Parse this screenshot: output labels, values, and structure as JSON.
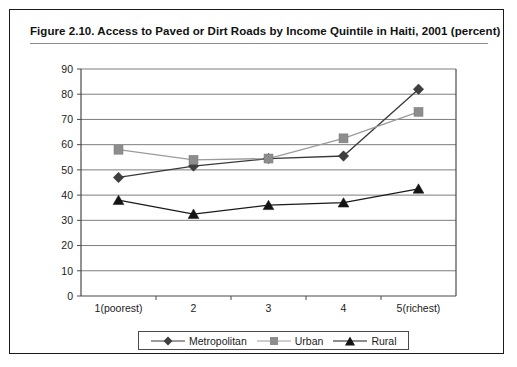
{
  "figure": {
    "title": "Figure 2.10.  Access to Paved or Dirt Roads by Income Quintile in Haiti, 2001 (percent)"
  },
  "chart_data": {
    "type": "line",
    "title": "Figure 2.10.  Access to Paved or Dirt Roads by Income Quintile in Haiti, 2001 (percent)",
    "xlabel": "",
    "ylabel": "",
    "categories": [
      "1(poorest)",
      "2",
      "3",
      "4",
      "5(richest)"
    ],
    "ylim": [
      0,
      90
    ],
    "yticks": [
      0,
      10,
      20,
      30,
      40,
      50,
      60,
      70,
      80,
      90
    ],
    "grid": true,
    "legend_position": "bottom",
    "series": [
      {
        "name": "Metropolitan",
        "marker": "diamond",
        "color": "#3f3f3f",
        "values": [
          47,
          51.5,
          54.5,
          55.5,
          82
        ]
      },
      {
        "name": "Urban",
        "marker": "square",
        "color": "#8d8d8d",
        "values": [
          58,
          54,
          54.5,
          62.5,
          73
        ]
      },
      {
        "name": "Rural",
        "marker": "triangle",
        "color": "#141414",
        "values": [
          38,
          32.5,
          36,
          37,
          42.5
        ]
      }
    ]
  },
  "legend": {
    "items": [
      {
        "label": "Metropolitan",
        "marker": "diamond-marker-icon"
      },
      {
        "label": "Urban",
        "marker": "square-marker-icon"
      },
      {
        "label": "Rural",
        "marker": "triangle-marker-icon"
      }
    ]
  }
}
